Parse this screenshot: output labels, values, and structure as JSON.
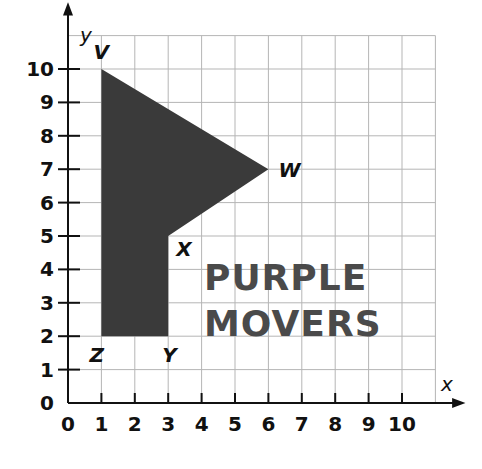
{
  "diagram": {
    "type": "coordinate-plane-figure",
    "axes": {
      "x_label": "x",
      "y_label": "y",
      "x_ticks": [
        "0",
        "1",
        "2",
        "3",
        "4",
        "5",
        "6",
        "7",
        "8",
        "9",
        "10"
      ],
      "y_ticks": [
        "0",
        "1",
        "2",
        "3",
        "4",
        "5",
        "6",
        "7",
        "8",
        "9",
        "10"
      ],
      "grid_range": {
        "x": [
          0,
          11
        ],
        "y": [
          0,
          11
        ]
      }
    },
    "polygon": {
      "fill": "#3a3a3a",
      "vertices": [
        {
          "label": "V",
          "x": 1,
          "y": 10
        },
        {
          "label": "W",
          "x": 6,
          "y": 7
        },
        {
          "label": "X",
          "x": 3,
          "y": 5
        },
        {
          "label": "Y",
          "x": 3,
          "y": 2
        },
        {
          "label": "Z",
          "x": 1,
          "y": 2
        }
      ]
    },
    "logo": {
      "line1": "PURPLE",
      "line2": "MOVERS",
      "color": "#4a4a4a"
    }
  }
}
